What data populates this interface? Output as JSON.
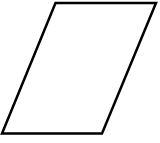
{
  "diagram": {
    "shape": "parallelogram",
    "stroke_color": "#000000",
    "fill_color": "#ffffff",
    "stroke_width": 2.5,
    "vertices": [
      [
        55.5,
        3
      ],
      [
        156,
        3
      ],
      [
        102,
        133.5
      ],
      [
        2,
        133.5
      ]
    ]
  }
}
